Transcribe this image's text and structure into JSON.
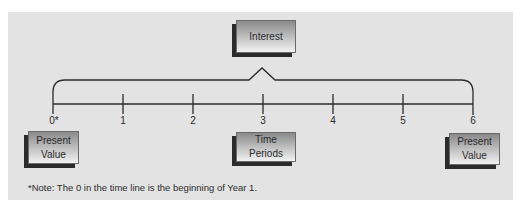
{
  "diagram": {
    "type": "time-value-of-money timeline",
    "top_box": {
      "label": "Interest"
    },
    "timeline": {
      "ticks": [
        "0*",
        "1",
        "2",
        "3",
        "4",
        "5",
        "6"
      ]
    },
    "bottom_boxes": {
      "left": {
        "line1": "Present",
        "line2": "Value"
      },
      "center": {
        "label": "Time Periods"
      },
      "right": {
        "line1": "Present",
        "line2": "Value"
      }
    },
    "note": "*Note: The 0 in the time line is the beginning of Year 1.",
    "colors": {
      "panel_bg": "#e3e3e3",
      "line": "#2b2b2b",
      "box_shadow": "#2b2b2b"
    }
  }
}
